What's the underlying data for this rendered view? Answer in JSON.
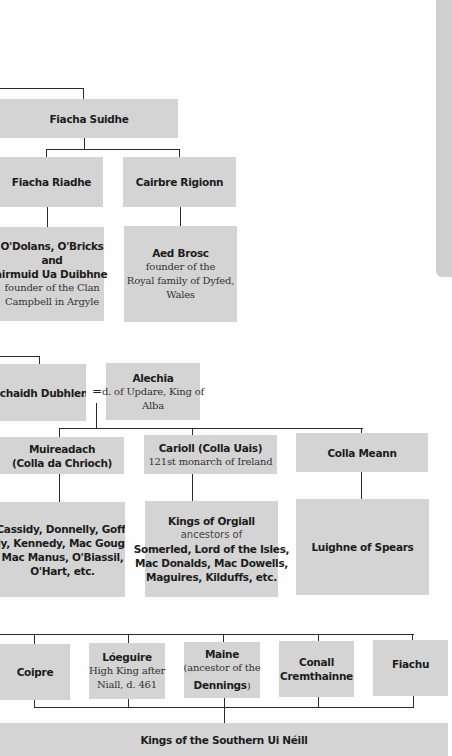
{
  "side_strip": {
    "color": "#cfcfcf"
  },
  "colors": {
    "box": "#d4d4d4",
    "line": "#2a2a2a"
  },
  "tree": {
    "fiacha_suidhe": {
      "name": "Fiacha Suidhe"
    },
    "fiacha_riadhe": {
      "name": "Fiacha Riadhe"
    },
    "cairbre_rigionn": {
      "name": "Cairbre Rigionn"
    },
    "odolans": {
      "line1": "O'Dolans, O'Bricks",
      "line2": "and",
      "line3": "Dairmuid Ua Duibhne",
      "desc1": "founder of the Clan",
      "desc2": "Campbell in Argyle"
    },
    "aed_brosc": {
      "name": "Aed Brosc",
      "desc1": "founder of the",
      "desc2": "Royal family of Dyfed,",
      "desc3": "Wales"
    },
    "eochaidh": {
      "name": "Eochaidh Dubhlen"
    },
    "marriage_symbol": "=",
    "alechia": {
      "name": "Alechia",
      "desc1": "d. of Updare, King of",
      "desc2": "Alba"
    },
    "muireadach": {
      "line1": "Muireadach",
      "line2": "(Colla da Chrioch)"
    },
    "carioll": {
      "name": "Carioll (Colla Uais)",
      "desc": "121st monarch of Ireland"
    },
    "colla_meann": {
      "name": "Colla Meann"
    },
    "cassidy": {
      "line1": "Cassidy, Donnelly, Goff,",
      "line2": "Kelly, Kennedy, Mac Gough,",
      "line3": "Mac Manus, O'Biassil,",
      "line4": "O'Hart, etc."
    },
    "orgiall": {
      "name": "Kings of Orgiall",
      "desc": "ancestors of",
      "line1": "Somerled, Lord of the Isles,",
      "line2": "Mac Donalds, Mac Dowells,",
      "line3": "Maguires, Kilduffs, etc."
    },
    "luighne": {
      "name": "Luighne of Spears"
    },
    "coipre": {
      "name": "Coipre"
    },
    "loeguire": {
      "name": "Lóeguire",
      "desc1": "High King after",
      "desc2": "Niall, d. 461"
    },
    "maine": {
      "desc1": "(ancestor of the",
      "name": "Dennings",
      "close": ")",
      "title": "Maine"
    },
    "conall": {
      "line1": "Conall",
      "line2": "Cremthainne"
    },
    "fiachu": {
      "name": "Fiachu"
    },
    "southern_ui_neill": {
      "name": "Kings of the Southern Ui Néill"
    }
  }
}
